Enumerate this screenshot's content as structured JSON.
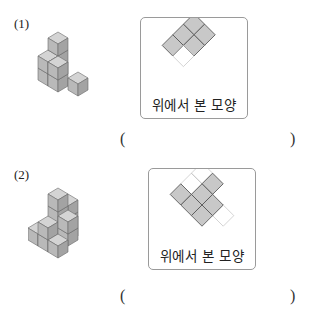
{
  "problems": [
    {
      "number": "(1)",
      "figure": "isometric-cube-stack",
      "top_view": {
        "caption": "위에서 본 모양",
        "filled_cells": 5,
        "dashed_cells": 1,
        "fill_color": "#c8c8c8",
        "stroke_color": "#555555"
      },
      "answer": {
        "open": "(",
        "close": ")",
        "value": ""
      }
    },
    {
      "number": "(2)",
      "figure": "isometric-cube-stack",
      "top_view": {
        "caption": "위에서 본 모양",
        "filled_cells": 6,
        "dashed_cells": 3,
        "fill_color": "#c8c8c8",
        "stroke_color": "#555555"
      },
      "answer": {
        "open": "(",
        "close": ")",
        "value": ""
      }
    }
  ]
}
